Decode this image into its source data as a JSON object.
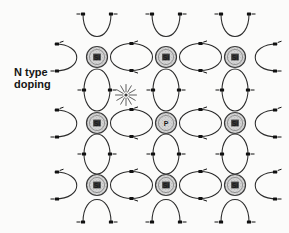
{
  "figure": {
    "width": 289,
    "height": 233,
    "background_color": "#fbfbfa",
    "caption": "N type\ndoping",
    "caption_line_1": "N type",
    "caption_line_2": "doping"
  },
  "colors": {
    "stroke": "#2b2b2b",
    "atom_fill": "#cfcfcf",
    "atom_stroke": "#3a3a3a",
    "electron": "#111111",
    "text": "#151515",
    "free_electron": "#5a5a5a"
  },
  "legend": {
    "atom_si": "Si",
    "atom_p": "P",
    "free_electron_symbol": "starburst"
  },
  "lattice": {
    "columns": 3,
    "rows": 3,
    "col_x": [
      97,
      166,
      235
    ],
    "row_y": [
      57,
      123,
      185
    ],
    "atom_radius": 10.5,
    "atoms": [
      {
        "id": "a-0-0",
        "row": 0,
        "col": 0,
        "label": "Si",
        "element": "silicon",
        "cx": 97,
        "cy": 57
      },
      {
        "id": "a-0-1",
        "row": 0,
        "col": 1,
        "label": "Si",
        "element": "silicon",
        "cx": 166,
        "cy": 57
      },
      {
        "id": "a-0-2",
        "row": 0,
        "col": 2,
        "label": "Si",
        "element": "silicon",
        "cx": 235,
        "cy": 57
      },
      {
        "id": "a-1-0",
        "row": 1,
        "col": 0,
        "label": "Si",
        "element": "silicon",
        "cx": 97,
        "cy": 123
      },
      {
        "id": "a-1-1",
        "row": 1,
        "col": 1,
        "label": "P",
        "element": "phosphorus",
        "cx": 166,
        "cy": 123
      },
      {
        "id": "a-1-2",
        "row": 1,
        "col": 2,
        "label": "Si",
        "element": "silicon",
        "cx": 235,
        "cy": 123
      },
      {
        "id": "a-2-0",
        "row": 2,
        "col": 0,
        "label": "Si",
        "element": "silicon",
        "cx": 97,
        "cy": 185
      },
      {
        "id": "a-2-1",
        "row": 2,
        "col": 1,
        "label": "Si",
        "element": "silicon",
        "cx": 166,
        "cy": 185
      },
      {
        "id": "a-2-2",
        "row": 2,
        "col": 2,
        "label": "Si",
        "element": "silicon",
        "cx": 235,
        "cy": 185
      }
    ]
  },
  "free_electron": {
    "label": "free electron",
    "cx": 126,
    "cy": 95,
    "rays": 12,
    "inner_radius": 3,
    "outer_radius": 11
  }
}
